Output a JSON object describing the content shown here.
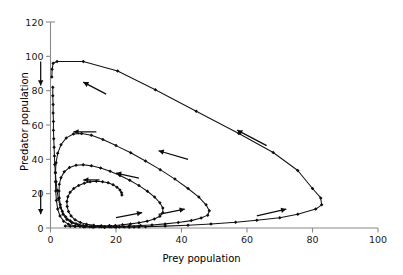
{
  "chart_data": {
    "type": "line",
    "title": "",
    "subtitle": "",
    "xlabel": "Prey population",
    "ylabel": "Predator population",
    "xlim": [
      0,
      100
    ],
    "ylim": [
      0,
      120
    ],
    "xticks": [
      0,
      20,
      40,
      60,
      80,
      100
    ],
    "yticks": [
      0,
      20,
      40,
      60,
      80,
      100,
      120
    ],
    "grid": false,
    "legend": null,
    "legend_position": "none",
    "marker": "diamond",
    "line_color": "#141414",
    "axis_color": "#8a8a8a",
    "background_color": "#ffffff",
    "annotations": [
      {
        "name": "flow-arrow-upper-left",
        "x_from": 17,
        "y_from": 78,
        "x_to": 10,
        "y_to": 85,
        "direction": "left"
      },
      {
        "name": "flow-arrow-upper-right",
        "x_from": 66,
        "y_from": 48,
        "x_to": 57,
        "y_to": 57,
        "direction": "upper-left"
      },
      {
        "name": "flow-arrow-mid-right",
        "x_from": 42,
        "y_from": 40,
        "x_to": 33,
        "y_to": 45,
        "direction": "upper-left"
      },
      {
        "name": "flow-arrow-loop2-top",
        "x_from": 14,
        "y_from": 56,
        "x_to": 7,
        "y_to": 56,
        "direction": "left"
      },
      {
        "name": "flow-arrow-loop3",
        "x_from": 27,
        "y_from": 29,
        "x_to": 20,
        "y_to": 32,
        "direction": "upper-left"
      },
      {
        "name": "flow-arrow-loop4-top",
        "x_from": 15,
        "y_from": 28,
        "x_to": 10,
        "y_to": 28,
        "direction": "left"
      },
      {
        "name": "flow-arrow-lower-inner",
        "x_from": 20,
        "y_from": 6,
        "x_to": 28,
        "y_to": 9,
        "direction": "right"
      },
      {
        "name": "flow-arrow-lower-mid",
        "x_from": 33,
        "y_from": 8,
        "x_to": 41,
        "y_to": 11,
        "direction": "right"
      },
      {
        "name": "flow-arrow-lower-right",
        "x_from": 63,
        "y_from": 7,
        "x_to": 72,
        "y_to": 11,
        "direction": "right"
      },
      {
        "name": "decay-arrow-top-axis",
        "x_from": -3,
        "y_from": 97,
        "x_to": -3,
        "y_to": 83,
        "direction": "down"
      },
      {
        "name": "decay-arrow-bottom-axis",
        "x_from": -3,
        "y_from": 22,
        "x_to": -3,
        "y_to": 8,
        "direction": "down"
      }
    ],
    "series": [
      {
        "name": "loop-1-outer",
        "points": [
          [
            0.4,
            88
          ],
          [
            0.5,
            92.5
          ],
          [
            0.8,
            96
          ],
          [
            2.0,
            97
          ],
          [
            10.0,
            97
          ],
          [
            20.5,
            91.5
          ],
          [
            32.0,
            80.5
          ],
          [
            44.5,
            68.0
          ],
          [
            57.5,
            55.0
          ],
          [
            68.0,
            44.0
          ],
          [
            75.5,
            33.5
          ],
          [
            80.0,
            23.0
          ],
          [
            82.5,
            17.5
          ],
          [
            82.8,
            13.5
          ],
          [
            81.0,
            11.0
          ],
          [
            75.5,
            8.0
          ],
          [
            70.0,
            6.0
          ],
          [
            63.0,
            4.5
          ],
          [
            56.5,
            3.3
          ],
          [
            49.0,
            2.3
          ],
          [
            42.0,
            1.6
          ],
          [
            35.0,
            1.1
          ],
          [
            29.0,
            0.8
          ],
          [
            24.0,
            0.6
          ],
          [
            20.0,
            0.5
          ],
          [
            16.5,
            0.45
          ]
        ]
      },
      {
        "name": "loop-2",
        "points": [
          [
            16.5,
            0.45
          ],
          [
            13.0,
            0.5
          ],
          [
            10.0,
            0.7
          ],
          [
            7.5,
            1.2
          ],
          [
            5.5,
            2.2
          ],
          [
            4.0,
            4.0
          ],
          [
            2.9,
            7.0
          ],
          [
            2.2,
            11.0
          ],
          [
            1.8,
            16.0
          ],
          [
            1.6,
            21.5
          ],
          [
            1.5,
            27.0
          ],
          [
            1.5,
            32.5
          ],
          [
            1.7,
            38.0
          ],
          [
            2.2,
            43.5
          ],
          [
            3.2,
            48.5
          ],
          [
            4.8,
            52.5
          ],
          [
            7.0,
            54.8
          ],
          [
            9.5,
            55.0
          ],
          [
            12.5,
            54.0
          ],
          [
            16.0,
            51.5
          ],
          [
            20.0,
            48.0
          ],
          [
            24.5,
            43.8
          ],
          [
            29.0,
            39.0
          ],
          [
            33.5,
            34.0
          ],
          [
            38.0,
            28.5
          ],
          [
            42.0,
            23.0
          ],
          [
            45.3,
            18.0
          ],
          [
            47.5,
            13.5
          ],
          [
            48.5,
            10.0
          ],
          [
            48.0,
            7.5
          ],
          [
            46.0,
            5.8
          ],
          [
            43.0,
            4.3
          ],
          [
            39.0,
            3.2
          ],
          [
            35.0,
            2.4
          ],
          [
            31.0,
            1.8
          ],
          [
            27.5,
            1.4
          ],
          [
            24.0,
            1.1
          ],
          [
            21.0,
            0.9
          ],
          [
            18.5,
            0.75
          ]
        ]
      },
      {
        "name": "loop-3",
        "points": [
          [
            18.5,
            0.75
          ],
          [
            15.5,
            0.8
          ],
          [
            12.5,
            1.0
          ],
          [
            10.0,
            1.5
          ],
          [
            7.8,
            2.5
          ],
          [
            6.0,
            4.2
          ],
          [
            4.6,
            6.6
          ],
          [
            3.6,
            9.8
          ],
          [
            3.0,
            13.5
          ],
          [
            2.7,
            17.5
          ],
          [
            2.6,
            21.5
          ],
          [
            2.7,
            25.5
          ],
          [
            3.2,
            29.3
          ],
          [
            4.2,
            32.7
          ],
          [
            5.8,
            35.3
          ],
          [
            7.8,
            36.6
          ],
          [
            10.0,
            36.8
          ],
          [
            12.5,
            36.2
          ],
          [
            15.3,
            34.9
          ],
          [
            18.2,
            33.0
          ],
          [
            21.2,
            30.6
          ],
          [
            24.2,
            27.8
          ],
          [
            27.0,
            24.7
          ],
          [
            29.6,
            21.4
          ],
          [
            31.8,
            18.0
          ],
          [
            33.4,
            14.7
          ],
          [
            34.3,
            11.6
          ],
          [
            34.3,
            8.9
          ],
          [
            33.4,
            6.8
          ],
          [
            31.7,
            5.2
          ],
          [
            29.5,
            4.0
          ],
          [
            27.0,
            3.1
          ],
          [
            24.4,
            2.4
          ],
          [
            22.0,
            1.9
          ],
          [
            19.8,
            1.5
          ],
          [
            18.0,
            1.25
          ]
        ]
      },
      {
        "name": "loop-4-inner",
        "points": [
          [
            18.0,
            1.25
          ],
          [
            15.5,
            1.3
          ],
          [
            13.2,
            1.6
          ],
          [
            11.0,
            2.2
          ],
          [
            9.1,
            3.2
          ],
          [
            7.5,
            4.8
          ],
          [
            6.3,
            7.0
          ],
          [
            5.5,
            9.6
          ],
          [
            5.1,
            12.5
          ],
          [
            5.0,
            15.4
          ],
          [
            5.3,
            18.2
          ],
          [
            6.0,
            20.8
          ],
          [
            7.1,
            23.0
          ],
          [
            8.6,
            24.8
          ],
          [
            10.3,
            26.1
          ],
          [
            12.1,
            26.9
          ],
          [
            14.0,
            27.2
          ],
          [
            15.9,
            27.0
          ],
          [
            17.6,
            26.3
          ],
          [
            19.1,
            25.2
          ],
          [
            20.3,
            23.8
          ],
          [
            21.2,
            22.2
          ],
          [
            21.7,
            20.6
          ],
          [
            21.8,
            19.2
          ]
        ]
      },
      {
        "name": "settling-cluster-left",
        "points": [
          [
            0.7,
            82
          ],
          [
            0.7,
            77
          ],
          [
            0.8,
            72
          ],
          [
            0.8,
            67
          ],
          [
            0.9,
            62
          ],
          [
            0.9,
            57
          ],
          [
            1.0,
            52
          ],
          [
            1.1,
            47
          ],
          [
            1.2,
            42
          ],
          [
            1.3,
            37
          ],
          [
            1.5,
            32
          ],
          [
            1.7,
            27
          ],
          [
            2.0,
            22
          ],
          [
            2.4,
            17
          ],
          [
            3.0,
            12
          ],
          [
            3.8,
            8
          ],
          [
            5.0,
            5
          ],
          [
            6.5,
            3
          ],
          [
            8.5,
            1.8
          ],
          [
            11.0,
            1.2
          ]
        ]
      },
      {
        "name": "settling-cluster-bottom",
        "points": [
          [
            4.5,
            1.2
          ],
          [
            6.0,
            1.0
          ],
          [
            7.5,
            0.9
          ],
          [
            9.0,
            0.85
          ],
          [
            10.5,
            0.8
          ],
          [
            12.0,
            0.78
          ],
          [
            13.5,
            0.75
          ],
          [
            15.0,
            0.72
          ],
          [
            16.5,
            0.7
          ],
          [
            18.0,
            0.68
          ],
          [
            19.5,
            0.66
          ],
          [
            21.0,
            0.64
          ],
          [
            22.5,
            0.62
          ],
          [
            24.0,
            0.6
          ],
          [
            25.5,
            0.58
          ],
          [
            27.0,
            0.56
          ]
        ]
      }
    ]
  }
}
